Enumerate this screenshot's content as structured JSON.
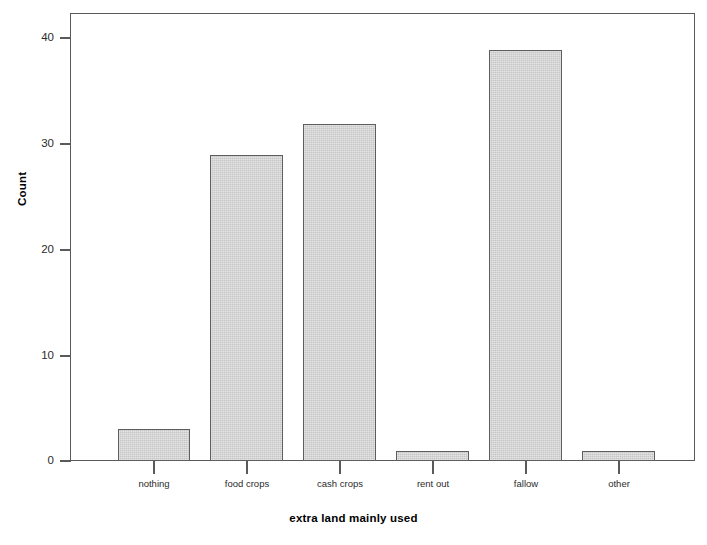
{
  "chart_data": {
    "type": "bar",
    "title": "",
    "xlabel": "extra land mainly used",
    "ylabel": "Count",
    "categories": [
      "nothing",
      "food crops",
      "cash crops",
      "rent out",
      "fallow",
      "other"
    ],
    "values": [
      3,
      29,
      32,
      1,
      39,
      1
    ],
    "ylim": [
      0,
      42.5
    ],
    "yticks": [
      0,
      10,
      20,
      30,
      40
    ],
    "ytick_labels": [
      "0",
      "10",
      "20",
      "30",
      "40"
    ],
    "grid": false,
    "legend": null,
    "bar_color": "#c6c6c6",
    "bar_edge_color": "#5e5e5e",
    "frame_color": "#5a5a5a",
    "background_color": "#ffffff"
  }
}
